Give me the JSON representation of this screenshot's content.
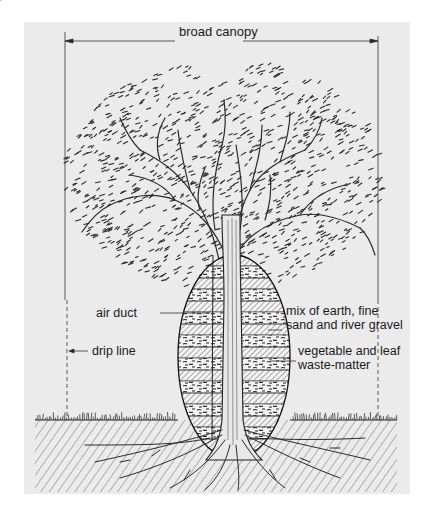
{
  "diagram": {
    "type": "annotated tree cross-section",
    "labels": {
      "canopy": "broad canopy",
      "air_duct": "air duct",
      "drip_line": "drip line",
      "mix_line1": "mix of earth, fine",
      "mix_line2": "sand and river gravel",
      "veg_line1": "vegetable and leaf",
      "veg_line2": "waste-matter"
    },
    "colors": {
      "panel": "#ebebeb",
      "ink": "#1a1a1a",
      "background": "#ffffff"
    }
  }
}
